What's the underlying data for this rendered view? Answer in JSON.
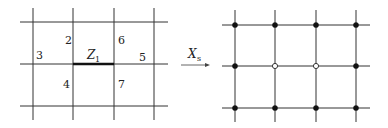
{
  "left_grid": {
    "vertical_x": [
      33,
      73,
      114,
      154
    ],
    "horizontal_y": [
      22,
      64,
      106
    ],
    "x_range": [
      20,
      168
    ],
    "y_range": [
      8,
      120
    ],
    "highlighted_edge": {
      "x1": 73,
      "x2": 114,
      "y": 64,
      "label": "Z",
      "label_sub": "1"
    },
    "cell_labels": [
      {
        "text": "2",
        "x": 65,
        "y": 44
      },
      {
        "text": "6",
        "x": 118,
        "y": 44
      },
      {
        "text": "3",
        "x": 36,
        "y": 59
      },
      {
        "text": "5",
        "x": 139,
        "y": 61
      },
      {
        "text": "4",
        "x": 63,
        "y": 88
      },
      {
        "text": "7",
        "x": 118,
        "y": 88
      }
    ]
  },
  "arrow": {
    "label": "X",
    "label_sub": "s",
    "x1": 181,
    "x2": 210,
    "y": 65
  },
  "right_grid": {
    "vertical_x": [
      235,
      275,
      316,
      356
    ],
    "horizontal_y": [
      25,
      66,
      108
    ],
    "x_range": [
      222,
      370
    ],
    "y_range": [
      10,
      122
    ],
    "hollow_nodes": [
      [
        275,
        66
      ],
      [
        316,
        66
      ]
    ]
  },
  "colors": {
    "line": "#333333",
    "bold_edge": "#111111",
    "node_fill": "#111111",
    "hollow_fill": "#ffffff"
  }
}
